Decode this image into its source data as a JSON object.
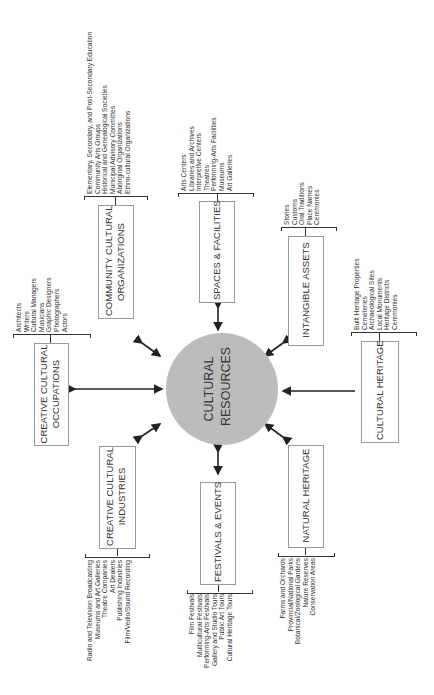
{
  "center": {
    "label_line1": "CULTURAL",
    "label_line2": "RESOURCES",
    "fill": "#bcbcbc"
  },
  "categories": {
    "community_cultural_organizations": {
      "label_line1": "COMMUNITY CULTURAL",
      "label_line2": "ORGANIZATIONS",
      "items": [
        "Elementary, Secondary, and Post-Secondary Education",
        "Community Arts Groups",
        "Historical and Genealogical Societies",
        "Municipal Advisory Committes",
        "Aboriginal Organizations",
        "Ethno-cultural Organizations"
      ]
    },
    "creative_cultural_occupations": {
      "label_line1": "CREATIVE CULTURAL",
      "label_line2": "OCCUPATIONS",
      "items": [
        "Architects",
        "Writers",
        "Cultural Managers",
        "Musicians",
        "Graphic Designers",
        "Photographers",
        "Actors"
      ]
    },
    "creative_cultural_industries": {
      "label_line1": "CREATIVE CULTURAL",
      "label_line2": "INDUSTRIES",
      "items": [
        "Radio and Television Broadcasting",
        "Museums and Art Galleries",
        "Theatre Companies",
        "Art Dealers",
        "Publishing Industries",
        "Film/Vedio/Sound Recording"
      ]
    },
    "spaces_facilities": {
      "label": "SPACES & FACILITIES",
      "items": [
        "Arts Centers",
        "Libraries and Archives",
        "Interpretive Centers",
        "Theatres",
        "Performing-Arts Facilities",
        "Museums",
        "Art Galleries"
      ]
    },
    "festivals_events": {
      "label": "FESTIVALS & EVENTS",
      "items": [
        "Film Festivals",
        "Multicultural Festivals",
        "Performing-Arts Festivals",
        "Gallery and Studio Tours",
        "Public Art Tours",
        "Cultural Heritage Tours"
      ]
    },
    "intangible_assets": {
      "label": "INTANGIBLE ASSETS",
      "items": [
        "Stories",
        "Customs",
        "Oral Traditions",
        "Place Names",
        "Ceremonies"
      ]
    },
    "cultural_heritage": {
      "label": "CULTURAL HERITAGE",
      "items": [
        "Built Heritage Properties",
        "Cemeteries",
        "Archaeological Sites",
        "Local Monuments",
        "Heritage Districts",
        "Ceremonies"
      ]
    },
    "natural_heritage": {
      "label": "NATURAL HERITAGE",
      "items": [
        "Farms and Orchards",
        "Provincial/National Parks",
        "Botanical/Zoological Gardens",
        "Nature Reserves",
        "Conservation Areas"
      ]
    }
  },
  "colors": {
    "text": "#333333",
    "box_border": "#999999",
    "arrow": "#222222"
  }
}
